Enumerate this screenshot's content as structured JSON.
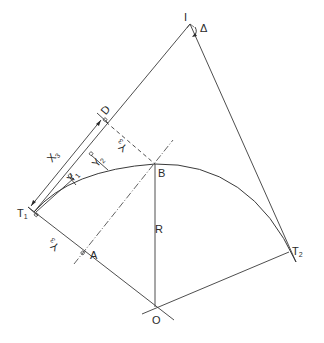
{
  "diagram": {
    "type": "circular-curve-offsets-from-tangent",
    "points": {
      "I": {
        "label": "I",
        "x": 190,
        "y": 26
      },
      "D": {
        "label": "D",
        "x": 103,
        "y": 117
      },
      "B": {
        "label": "B",
        "x": 155,
        "y": 164
      },
      "T1": {
        "label": "T",
        "sub": "1",
        "x": 34,
        "y": 212
      },
      "A": {
        "label": "A",
        "x": 82,
        "y": 253
      },
      "O": {
        "label": "O",
        "x": 155,
        "y": 307
      },
      "T2": {
        "label": "T",
        "sub": "2",
        "x": 288,
        "y": 252
      }
    },
    "labels": {
      "delta": "Δ",
      "radius": "R",
      "x3": "X",
      "x3_sub": "3",
      "y1": "Y",
      "y1_sub": "1",
      "y2": "Y",
      "y2_sub": "2",
      "y3_top": "Y",
      "y3_top_sub": "3",
      "y3_bottom": "Y",
      "y3_bottom_sub": "3"
    },
    "colors": {
      "line": "#3a3a3a",
      "text": "#2a2a2a",
      "background": "#ffffff"
    }
  },
  "caption": ""
}
